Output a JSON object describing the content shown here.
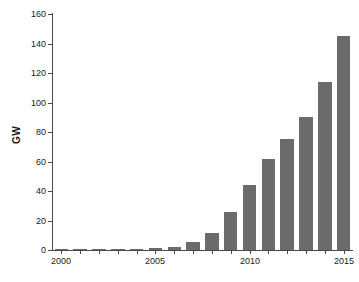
{
  "chart_data": {
    "type": "bar",
    "title": "",
    "subtitle": "",
    "xlabel": "",
    "ylabel": "GW",
    "categories": [
      2000,
      2001,
      2002,
      2003,
      2004,
      2005,
      2006,
      2007,
      2008,
      2009,
      2010,
      2011,
      2012,
      2013,
      2014,
      2015
    ],
    "values": [
      0.1,
      0.2,
      0.3,
      0.5,
      0.8,
      1.4,
      2.2,
      5.4,
      11.8,
      25.5,
      44.0,
      62.0,
      75.0,
      90.5,
      114.0,
      145.0
    ],
    "series": [
      {
        "name": "Capacity",
        "values": [
          0.1,
          0.2,
          0.3,
          0.5,
          0.8,
          1.4,
          2.2,
          5.4,
          11.8,
          25.5,
          44.0,
          62.0,
          75.0,
          90.5,
          114.0,
          145.0
        ],
        "color": "#6b6b6b"
      }
    ],
    "ylim": [
      0,
      160
    ],
    "xlim": [
      1999.5,
      2015.5
    ],
    "yticks": [
      0,
      20,
      40,
      60,
      80,
      100,
      120,
      140,
      160
    ],
    "ytick_labels": [
      "0",
      "20",
      "40",
      "60",
      "80",
      "100",
      "120",
      "140",
      "160"
    ],
    "xticks": [
      2000,
      2005,
      2010,
      2015
    ],
    "xtick_labels": [
      "2000",
      "2005",
      "2010",
      "2015"
    ],
    "grid": false,
    "legend": null,
    "legend_position": "none",
    "annotations": []
  },
  "colors": {
    "bar": "#6b6b6b",
    "axis": "#4a4a4a",
    "text": "#1a1a1a",
    "background": "#ffffff"
  }
}
